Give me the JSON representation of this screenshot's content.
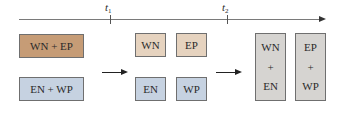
{
  "timeline": {
    "markers": [
      {
        "symbol": "t",
        "subscript": "1"
      },
      {
        "symbol": "t",
        "subscript": "2"
      }
    ]
  },
  "stage1": {
    "top": {
      "label": "WN + EP",
      "color": "#c69c76"
    },
    "bottom": {
      "label": "EN + WP",
      "color": "#c6d2e1"
    }
  },
  "stage2": {
    "top_left": {
      "label": "WN",
      "color": "#e6d3bf"
    },
    "top_right": {
      "label": "EP",
      "color": "#e6d3bf"
    },
    "bottom_left": {
      "label": "EN",
      "color": "#c6d2e1"
    },
    "bottom_right": {
      "label": "WP",
      "color": "#c6d2e1"
    }
  },
  "stage3": {
    "left": {
      "top": "WN",
      "plus": "+",
      "bottom": "EN",
      "color": "#d6d4d1"
    },
    "right": {
      "top": "EP",
      "plus": "+",
      "bottom": "WP",
      "color": "#d6d4d1"
    }
  }
}
